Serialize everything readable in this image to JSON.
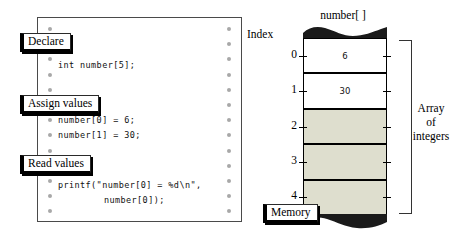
{
  "code_panel": {
    "name": "code-listing",
    "callouts": [
      {
        "id": "declare",
        "label": "Declare",
        "x": 20,
        "y": 33
      },
      {
        "id": "assign-values",
        "label": "Assign values",
        "x": 20,
        "y": 95
      },
      {
        "id": "read-values",
        "label": "Read values",
        "x": 20,
        "y": 155
      }
    ],
    "lines": [
      {
        "id": "declare-stmt",
        "text": "int number[5];",
        "y": 60,
        "indent": 0
      },
      {
        "id": "assign-0",
        "text": "number[0] = 6;",
        "y": 115,
        "indent": 0
      },
      {
        "id": "assign-1",
        "text": "number[1] = 30;",
        "y": 130,
        "indent": 0
      },
      {
        "id": "printf-stmt",
        "text": "printf(\"number[0] = %d\\n\",",
        "y": 180,
        "indent": 0
      },
      {
        "id": "printf-arg",
        "text": "number[0]);",
        "y": 195,
        "indent": 46
      }
    ]
  },
  "memory_diagram": {
    "array_title": "number[ ]",
    "index_label": "Index",
    "memory_label": "Memory",
    "bracket_label_lines": [
      "Array",
      "of",
      "integers"
    ],
    "cells": [
      {
        "index": "0",
        "value": "6",
        "state": "filled"
      },
      {
        "index": "1",
        "value": "30",
        "state": "filled"
      },
      {
        "index": "2",
        "value": "",
        "state": "empty"
      },
      {
        "index": "3",
        "value": "",
        "state": "empty"
      },
      {
        "index": "4",
        "value": "",
        "state": "empty"
      }
    ]
  },
  "colors": {
    "empty_cell": "#dedece",
    "torn_edge": "#1a1a1a",
    "panel_border": "#4a4a4a",
    "dot": "#a8a8a8"
  }
}
